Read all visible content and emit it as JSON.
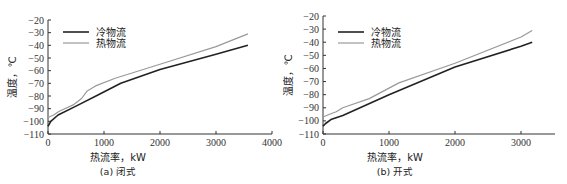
{
  "chart_data": [
    {
      "type": "line",
      "caption": "(a) 闭式",
      "xlabel": "热流率，kW",
      "ylabel": "温度，℃",
      "xlim": [
        0,
        4000
      ],
      "ylim": [
        -110,
        -20
      ],
      "xticks": [
        0,
        1000,
        2000,
        3000,
        4000
      ],
      "yticks": [
        -20,
        -30,
        -40,
        -50,
        -60,
        -70,
        -80,
        -90,
        -100,
        -110
      ],
      "grid": false,
      "legend_position": "upper left",
      "series": [
        {
          "name": "冷物流",
          "color": "#222222",
          "x": [
            0,
            50,
            180,
            500,
            900,
            1300,
            2000,
            3000,
            3570
          ],
          "y": [
            -104,
            -100,
            -95,
            -88,
            -79,
            -70,
            -59,
            -47,
            -40
          ]
        },
        {
          "name": "热物流",
          "color": "#999999",
          "x": [
            0,
            100,
            200,
            450,
            600,
            700,
            850,
            1200,
            2000,
            3000,
            3570
          ],
          "y": [
            -97,
            -95,
            -92,
            -87,
            -82,
            -76,
            -72,
            -66,
            -55,
            -41,
            -31
          ]
        }
      ]
    },
    {
      "type": "line",
      "caption": "(b) 开式",
      "xlabel": "热流率，kW",
      "ylabel": "温度，℃",
      "xlim": [
        0,
        3500
      ],
      "ylim": [
        -110,
        -20
      ],
      "xticks": [
        0,
        1000,
        2000,
        3000
      ],
      "yticks": [
        -20,
        -30,
        -40,
        -50,
        -60,
        -70,
        -80,
        -90,
        -100,
        -110
      ],
      "grid": false,
      "legend_position": "upper left",
      "series": [
        {
          "name": "冷物流",
          "color": "#222222",
          "x": [
            0,
            40,
            120,
            300,
            1000,
            2000,
            3000,
            3170
          ],
          "y": [
            -104,
            -102,
            -99,
            -96,
            -80,
            -59,
            -43,
            -40
          ]
        },
        {
          "name": "热物流",
          "color": "#999999",
          "x": [
            0,
            100,
            200,
            300,
            700,
            1150,
            2000,
            3000,
            3170
          ],
          "y": [
            -97,
            -95,
            -93,
            -90,
            -83,
            -71,
            -56,
            -36,
            -31
          ]
        }
      ]
    }
  ],
  "panels": [
    {
      "caption": "(a) 闭式",
      "xlabel": "热流率，kW",
      "ylabel": "温度，℃",
      "legend": [
        "冷物流",
        "热物流"
      ],
      "xtick_labels": [
        "0",
        "1000",
        "2000",
        "3000",
        "4000"
      ],
      "ytick_labels": [
        "-20",
        "-30",
        "-40",
        "-50",
        "-60",
        "-70",
        "-80",
        "-90",
        "-100",
        "-110"
      ]
    },
    {
      "caption": "(b) 开式",
      "xlabel": "热流率，kW",
      "ylabel": "温度，℃",
      "legend": [
        "冷物流",
        "热物流"
      ],
      "xtick_labels": [
        "0",
        "1000",
        "2000",
        "3000"
      ],
      "ytick_labels": [
        "-20",
        "-30",
        "-40",
        "-50",
        "-60",
        "-70",
        "-80",
        "-90",
        "-100",
        "-110"
      ]
    }
  ]
}
